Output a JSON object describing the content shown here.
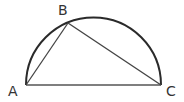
{
  "diagram": {
    "type": "geometry",
    "stroke_color": "#2a2a2a",
    "points": {
      "A": {
        "label": "A",
        "x": 26,
        "y": 85,
        "label_x": 8,
        "label_y": 96
      },
      "B": {
        "label": "B",
        "x": 68,
        "y": 23,
        "label_x": 58,
        "label_y": 15
      },
      "C": {
        "label": "C",
        "x": 161,
        "y": 85,
        "label_x": 166,
        "label_y": 96
      }
    },
    "segments": [
      {
        "from": "A",
        "to": "B"
      },
      {
        "from": "B",
        "to": "C"
      },
      {
        "from": "A",
        "to": "C"
      }
    ],
    "arc": {
      "center_x": 93.5,
      "center_y": 85,
      "radius": 67.5,
      "type": "semicircle"
    }
  }
}
